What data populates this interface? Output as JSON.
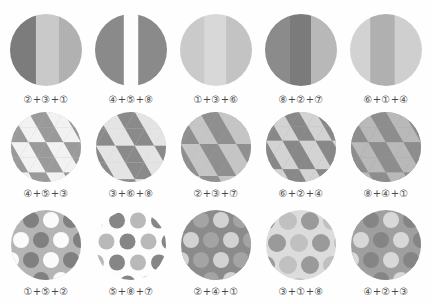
{
  "sheet": {
    "title": "Grayscale pattern swatch grid",
    "background": "#fefefe",
    "columns": 5,
    "rows": 3
  },
  "palette": {
    "very_dark": "#6f6f6f",
    "dark": "#7e7e7e",
    "mid_dark": "#8d8d8d",
    "mid": "#9d9d9d",
    "mid_light": "#b0b0b0",
    "light": "#c4c4c4",
    "very_light": "#d6d6d6",
    "pale": "#e3e3e3",
    "white": "#fdfdfd",
    "caption_color": "#4a4a4a"
  },
  "rows": [
    {
      "name": "stripes-row",
      "pattern_type": "vertical-stripes",
      "cells": [
        {
          "name": "swatch-stripes-1",
          "caption": "②+③+①",
          "codes": [
            2,
            3,
            1
          ],
          "bands": [
            {
              "width": 36,
              "color": "#7c7c7c"
            },
            {
              "width": 32,
              "color": "#c9c9c9"
            },
            {
              "width": 32,
              "color": "#b1b1b1"
            }
          ]
        },
        {
          "name": "swatch-stripes-2",
          "caption": "④+⑤+⑧",
          "codes": [
            4,
            5,
            8
          ],
          "bands": [
            {
              "width": 40,
              "color": "#8a8a8a"
            },
            {
              "width": 20,
              "color": "#fdfdfd"
            },
            {
              "width": 40,
              "color": "#8a8a8a"
            }
          ]
        },
        {
          "name": "swatch-stripes-3",
          "caption": "①+③+⑥",
          "codes": [
            1,
            3,
            6
          ],
          "bands": [
            {
              "width": 34,
              "color": "#cacaca"
            },
            {
              "width": 30,
              "color": "#d8d8d8"
            },
            {
              "width": 36,
              "color": "#c3c3c3"
            }
          ]
        },
        {
          "name": "swatch-stripes-4",
          "caption": "⑧+②+⑦",
          "codes": [
            8,
            2,
            7
          ],
          "bands": [
            {
              "width": 34,
              "color": "#8b8b8b"
            },
            {
              "width": 30,
              "color": "#7b7b7b"
            },
            {
              "width": 36,
              "color": "#b8b8b8"
            }
          ]
        },
        {
          "name": "swatch-stripes-5",
          "caption": "⑥+①+④",
          "codes": [
            6,
            1,
            4
          ],
          "bands": [
            {
              "width": 28,
              "color": "#d2d2d2"
            },
            {
              "width": 34,
              "color": "#b0b0b0"
            },
            {
              "width": 38,
              "color": "#cfcfcf"
            }
          ]
        }
      ]
    },
    {
      "name": "triangles-row",
      "pattern_type": "triangle-tessellation",
      "cells": [
        {
          "name": "swatch-triangles-1",
          "caption": "④+⑤+③",
          "codes": [
            4,
            5,
            3
          ],
          "colors": {
            "up": "#9a9a9a",
            "down": "#f2f2f2",
            "bg": "#c2c2c2"
          },
          "scale": 18
        },
        {
          "name": "swatch-triangles-2",
          "caption": "③+⑥+⑧",
          "codes": [
            3,
            6,
            8
          ],
          "colors": {
            "up": "#8a8a8a",
            "down": "#e4e4e4",
            "bg": "#cfcfcf"
          },
          "scale": 20
        },
        {
          "name": "swatch-triangles-3",
          "caption": "②+③+⑦",
          "codes": [
            2,
            3,
            7
          ],
          "colors": {
            "up": "#8f8f8f",
            "down": "#c5c5c5",
            "bg": "#b4b4b4"
          },
          "scale": 19
        },
        {
          "name": "swatch-triangles-4",
          "caption": "⑥+②+④",
          "codes": [
            6,
            2,
            4
          ],
          "colors": {
            "up": "#888888",
            "down": "#d3d3d3",
            "bg": "#a8a8a8"
          },
          "scale": 17
        },
        {
          "name": "swatch-triangles-5",
          "caption": "⑧+④+①",
          "codes": [
            8,
            4,
            1
          ],
          "colors": {
            "up": "#8d8d8d",
            "down": "#b9b9b9",
            "bg": "#9c9c9c"
          },
          "scale": 18
        }
      ]
    },
    {
      "name": "dots-row",
      "pattern_type": "polka-dots",
      "cells": [
        {
          "name": "swatch-dots-1",
          "caption": "①+⑤+②",
          "codes": [
            1,
            5,
            2
          ],
          "colors": {
            "bg": "#b5b5b5",
            "dot_a": "#fbfbfb",
            "dot_b": "#808080"
          },
          "radius": 8,
          "spacing": 20
        },
        {
          "name": "swatch-dots-2",
          "caption": "⑤+⑧+⑦",
          "codes": [
            5,
            8,
            7
          ],
          "colors": {
            "bg": "#fdfdfd",
            "dot_a": "#b9b9b9",
            "dot_b": "#868686"
          },
          "radius": 8,
          "spacing": 21
        },
        {
          "name": "swatch-dots-3",
          "caption": "②+④+①",
          "codes": [
            2,
            4,
            1
          ],
          "colors": {
            "bg": "#8b8b8b",
            "dot_a": "#d2d2d2",
            "dot_b": "#a4a4a4"
          },
          "radius": 8,
          "spacing": 20
        },
        {
          "name": "swatch-dots-4",
          "caption": "③+①+⑧",
          "codes": [
            3,
            1,
            8
          ],
          "colors": {
            "bg": "#dcdcdc",
            "dot_a": "#9a9a9a",
            "dot_b": "#c0c0c0"
          },
          "radius": 9,
          "spacing": 22
        },
        {
          "name": "swatch-dots-5",
          "caption": "④+②+③",
          "codes": [
            4,
            2,
            3
          ],
          "colors": {
            "bg": "#9f9f9f",
            "dot_a": "#d8d8d8",
            "dot_b": "#858585"
          },
          "radius": 8,
          "spacing": 20
        }
      ]
    }
  ]
}
